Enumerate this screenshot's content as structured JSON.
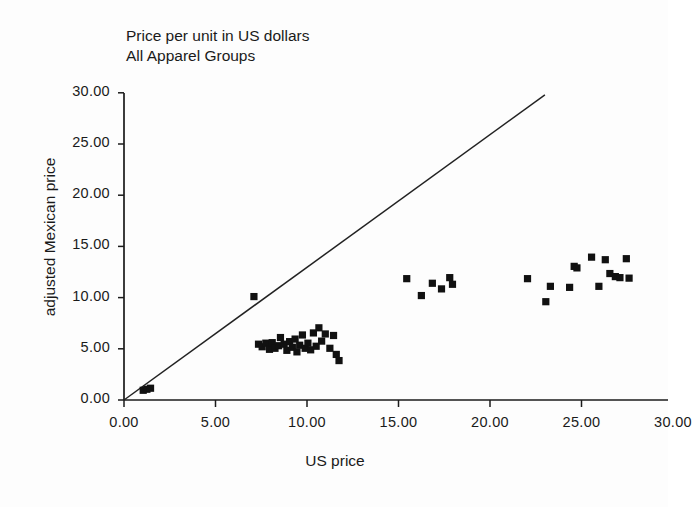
{
  "chart_data": {
    "type": "scatter",
    "title": "Price per unit in US dollars",
    "subtitle": "All Apparel Groups",
    "xlabel": "US price",
    "ylabel": "adjusted Mexican price",
    "xlim": [
      0,
      30
    ],
    "ylim": [
      0,
      30
    ],
    "xticks": [
      "0.00",
      "5.00",
      "10.00",
      "15.00",
      "20.00",
      "25.00",
      "30.00"
    ],
    "yticks": [
      "0.00",
      "5.00",
      "10.00",
      "15.00",
      "20.00",
      "25.00",
      "30.00"
    ],
    "xtick_values": [
      0,
      5,
      10,
      15,
      20,
      25,
      30
    ],
    "ytick_values": [
      0,
      5,
      10,
      15,
      20,
      25,
      30
    ],
    "grid": false,
    "legend": "none",
    "marker_style": "filled-square",
    "marker_color": "#111111",
    "reference_line": {
      "label": "45-degree parity line",
      "x": [
        0,
        23.0
      ],
      "y": [
        0,
        29.8
      ]
    },
    "points": [
      [
        1.05,
        0.95
      ],
      [
        1.25,
        1.05
      ],
      [
        1.45,
        1.15
      ],
      [
        7.1,
        10.1
      ],
      [
        7.35,
        5.45
      ],
      [
        7.55,
        5.2
      ],
      [
        7.75,
        5.55
      ],
      [
        7.95,
        4.95
      ],
      [
        8.1,
        5.6
      ],
      [
        8.25,
        5.05
      ],
      [
        8.45,
        5.3
      ],
      [
        8.55,
        6.1
      ],
      [
        8.75,
        5.45
      ],
      [
        8.9,
        4.85
      ],
      [
        9.05,
        5.7
      ],
      [
        9.2,
        5.15
      ],
      [
        9.35,
        5.95
      ],
      [
        9.45,
        4.7
      ],
      [
        9.6,
        5.35
      ],
      [
        9.75,
        6.35
      ],
      [
        9.9,
        5.05
      ],
      [
        10.05,
        5.55
      ],
      [
        10.2,
        4.9
      ],
      [
        10.35,
        6.55
      ],
      [
        10.5,
        5.25
      ],
      [
        10.65,
        7.05
      ],
      [
        10.8,
        5.75
      ],
      [
        11.0,
        6.45
      ],
      [
        11.25,
        5.05
      ],
      [
        11.45,
        6.3
      ],
      [
        11.6,
        4.45
      ],
      [
        11.75,
        3.85
      ],
      [
        15.45,
        11.85
      ],
      [
        16.25,
        10.2
      ],
      [
        16.85,
        11.4
      ],
      [
        17.35,
        10.85
      ],
      [
        17.8,
        11.95
      ],
      [
        17.95,
        11.3
      ],
      [
        22.05,
        11.85
      ],
      [
        23.05,
        9.6
      ],
      [
        23.3,
        11.1
      ],
      [
        24.35,
        11.0
      ],
      [
        24.6,
        13.05
      ],
      [
        24.75,
        12.9
      ],
      [
        25.55,
        13.95
      ],
      [
        25.95,
        11.1
      ],
      [
        26.3,
        13.7
      ],
      [
        26.55,
        12.35
      ],
      [
        26.85,
        12.05
      ],
      [
        27.1,
        11.95
      ],
      [
        27.45,
        13.8
      ],
      [
        27.6,
        11.9
      ]
    ]
  }
}
